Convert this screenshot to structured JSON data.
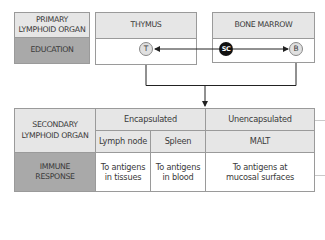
{
  "primary": {
    "label": "PRIMARY LYMPHOID ORGAN",
    "label_line1": "PRIMARY",
    "label_line2": "LYMPHOID ORGAN",
    "function": "EDUCATION",
    "organs": [
      {
        "name": "THYMUS",
        "cell": "T"
      },
      {
        "name": "BONE MARROW",
        "stem_cell": "SC",
        "cell": "B"
      }
    ]
  },
  "secondary": {
    "label_line1": "SECONDARY",
    "label_line2": "LYMPHOID ORGAN",
    "function_line1": "IMMUNE",
    "function_line2": "RESPONSE",
    "groups": [
      {
        "name": "Encapsulated",
        "organs": [
          {
            "name": "Lymph node",
            "response_line1": "To antigens",
            "response_line2": "in tissues"
          },
          {
            "name": "Spleen",
            "response_line1": "To antigens",
            "response_line2": "in blood"
          }
        ]
      },
      {
        "name": "Unencapsulated",
        "organs": [
          {
            "name": "MALT",
            "response_line1": "To antigens at",
            "response_line2": "mucosal surfaces"
          }
        ]
      }
    ]
  },
  "colors": {
    "header_fill": "#e6e6e6",
    "function_fill": "#a9a9a9",
    "border": "#9a9a9a",
    "stem_cell_fill": "#111111",
    "lymphocyte_fill": "#e0e0e0"
  }
}
